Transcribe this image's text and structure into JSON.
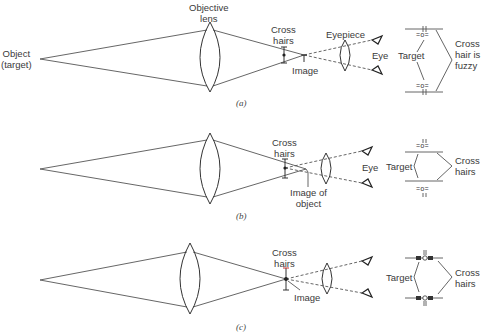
{
  "figure": {
    "panels": [
      {
        "id": "a",
        "caption": "(a)",
        "labels": {
          "object": "Object",
          "object_sub": "(target)",
          "objective": "Objective",
          "objective_sub": "lens",
          "cross": "Cross",
          "cross_sub": "hairs",
          "image": "Image",
          "eyepiece": "Eyepiece",
          "eye": "Eye",
          "target": "Target",
          "note1": "Cross",
          "note2": "hair is",
          "note3": "fuzzy"
        }
      },
      {
        "id": "b",
        "caption": "(b)",
        "labels": {
          "cross": "Cross",
          "cross_sub": "hairs",
          "image": "Image of",
          "image_sub": "object",
          "eye": "Eye",
          "target": "Target",
          "note1": "Cross",
          "note2": "hairs"
        }
      },
      {
        "id": "c",
        "caption": "(c)",
        "labels": {
          "cross": "Cross",
          "cross_sub": "hairs",
          "image": "Image",
          "target": "Target",
          "note1": "Cross",
          "note2": "hairs"
        }
      }
    ]
  }
}
